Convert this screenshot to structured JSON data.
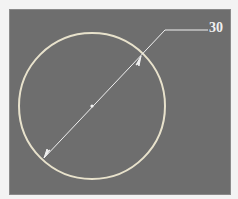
{
  "drawing": {
    "dimension_label": "30",
    "dimension_type": "diameter",
    "circle": {
      "cx": 92,
      "cy": 106,
      "r": 73
    },
    "colors": {
      "background": "#6e6e6e",
      "page": "#f3f3f3",
      "circle": "#e8e2cc",
      "dimension_line": "#f0f0f0"
    }
  }
}
